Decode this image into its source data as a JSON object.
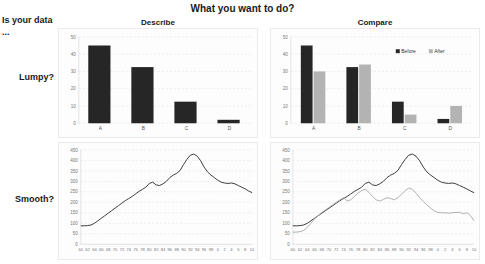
{
  "title": "What you want to do?",
  "row_header_corner": "Is your data ...",
  "columns": [
    {
      "id": "describe",
      "label": "Describe"
    },
    {
      "id": "compare",
      "label": "Compare"
    }
  ],
  "rows": [
    {
      "id": "lumpy",
      "label": "Lumpy?"
    },
    {
      "id": "smooth",
      "label": "Smooth?"
    }
  ],
  "chart_data": [
    {
      "id": "lumpy-describe",
      "type": "bar",
      "title": "Describe",
      "xlabel": "",
      "ylabel": "",
      "categories": [
        "A",
        "B",
        "C",
        "D"
      ],
      "values": [
        45,
        32.5,
        12.5,
        2
      ],
      "ylim": [
        0,
        50
      ],
      "yticks": [
        0,
        10,
        20,
        30,
        40,
        50
      ],
      "grid": true,
      "legend": false,
      "series_color": "#262626"
    },
    {
      "id": "lumpy-compare",
      "type": "bar",
      "title": "Compare",
      "xlabel": "",
      "ylabel": "",
      "categories": [
        "A",
        "B",
        "C",
        "D"
      ],
      "series": [
        {
          "name": "Before",
          "values": [
            45,
            32.5,
            12.5,
            2.5
          ],
          "color": "#262626"
        },
        {
          "name": "After",
          "values": [
            30,
            34,
            5,
            10
          ],
          "color": "#b3b3b3"
        }
      ],
      "ylim": [
        0,
        50
      ],
      "yticks": [
        0,
        10,
        20,
        30,
        40,
        50
      ],
      "grid": true,
      "legend": true,
      "legend_position": "top-right"
    },
    {
      "id": "smooth-describe",
      "type": "line",
      "title": "Describe",
      "xlabel": "",
      "ylabel": "",
      "ylim": [
        0,
        450
      ],
      "yticks": [
        0,
        50,
        100,
        150,
        200,
        250,
        300,
        350,
        400,
        450
      ],
      "xticks": [
        "60",
        "62",
        "64",
        "66",
        "68",
        "70",
        "72",
        "74",
        "76",
        "78",
        "80",
        "82",
        "84",
        "86",
        "88",
        "90",
        "92",
        "94",
        "96",
        "98",
        "0",
        "2",
        "4",
        "6",
        "8",
        "10"
      ],
      "grid": true,
      "legend": false,
      "series": [
        {
          "name": "Series 1",
          "color": "#3b3b3b",
          "x": [
            60,
            61,
            62,
            63,
            64,
            65,
            66,
            67,
            68,
            69,
            70,
            71,
            72,
            73,
            74,
            75,
            76,
            77,
            78,
            79,
            80,
            81,
            82,
            83,
            84,
            85,
            86,
            87,
            88,
            89,
            90,
            91,
            92,
            93,
            94,
            95,
            96,
            97,
            98,
            99,
            100,
            101,
            102,
            103,
            104,
            105,
            106,
            107,
            108,
            109,
            110
          ],
          "values": [
            88,
            88,
            89,
            92,
            100,
            112,
            124,
            136,
            148,
            160,
            172,
            184,
            196,
            208,
            218,
            228,
            240,
            252,
            262,
            272,
            290,
            296,
            283,
            280,
            288,
            300,
            318,
            330,
            338,
            352,
            380,
            405,
            425,
            430,
            420,
            398,
            368,
            345,
            330,
            318,
            305,
            296,
            292,
            290,
            292,
            288,
            280,
            272,
            264,
            254,
            246
          ]
        }
      ]
    },
    {
      "id": "smooth-compare",
      "type": "line",
      "title": "Compare",
      "xlabel": "",
      "ylabel": "",
      "ylim": [
        0,
        450
      ],
      "yticks": [
        0,
        50,
        100,
        150,
        200,
        250,
        300,
        350,
        400,
        450
      ],
      "xticks": [
        "60",
        "62",
        "64",
        "66",
        "68",
        "70",
        "72",
        "74",
        "76",
        "78",
        "80",
        "82",
        "84",
        "86",
        "88",
        "90",
        "92",
        "94",
        "96",
        "98",
        "0",
        "2",
        "4",
        "6",
        "8",
        "10"
      ],
      "grid": true,
      "legend": false,
      "series": [
        {
          "name": "Series 1",
          "color": "#3b3b3b",
          "x": [
            60,
            61,
            62,
            63,
            64,
            65,
            66,
            67,
            68,
            69,
            70,
            71,
            72,
            73,
            74,
            75,
            76,
            77,
            78,
            79,
            80,
            81,
            82,
            83,
            84,
            85,
            86,
            87,
            88,
            89,
            90,
            91,
            92,
            93,
            94,
            95,
            96,
            97,
            98,
            99,
            100,
            101,
            102,
            103,
            104,
            105,
            106,
            107,
            108,
            109,
            110
          ],
          "values": [
            88,
            88,
            89,
            92,
            100,
            112,
            124,
            136,
            148,
            160,
            172,
            184,
            196,
            208,
            218,
            228,
            240,
            252,
            262,
            272,
            290,
            296,
            283,
            280,
            288,
            300,
            318,
            330,
            338,
            352,
            380,
            405,
            425,
            430,
            420,
            398,
            368,
            345,
            330,
            318,
            305,
            296,
            292,
            290,
            292,
            288,
            280,
            272,
            264,
            254,
            246
          ]
        },
        {
          "name": "Series 2",
          "color": "#b0b0b0",
          "x": [
            60,
            61,
            62,
            63,
            64,
            65,
            66,
            67,
            68,
            69,
            70,
            71,
            72,
            73,
            74,
            75,
            76,
            77,
            78,
            79,
            80,
            81,
            82,
            83,
            84,
            85,
            86,
            87,
            88,
            89,
            90,
            91,
            92,
            93,
            94,
            95,
            96,
            97,
            98,
            99,
            100,
            101,
            102,
            103,
            104,
            105,
            106,
            107,
            108,
            109,
            110
          ],
          "values": [
            58,
            58,
            60,
            66,
            80,
            100,
            120,
            138,
            152,
            164,
            176,
            188,
            200,
            212,
            222,
            206,
            212,
            228,
            244,
            256,
            262,
            248,
            228,
            212,
            206,
            214,
            222,
            218,
            212,
            222,
            238,
            256,
            268,
            262,
            244,
            222,
            204,
            188,
            172,
            160,
            152,
            150,
            150,
            148,
            150,
            152,
            152,
            146,
            150,
            138,
            112
          ]
        }
      ]
    }
  ]
}
